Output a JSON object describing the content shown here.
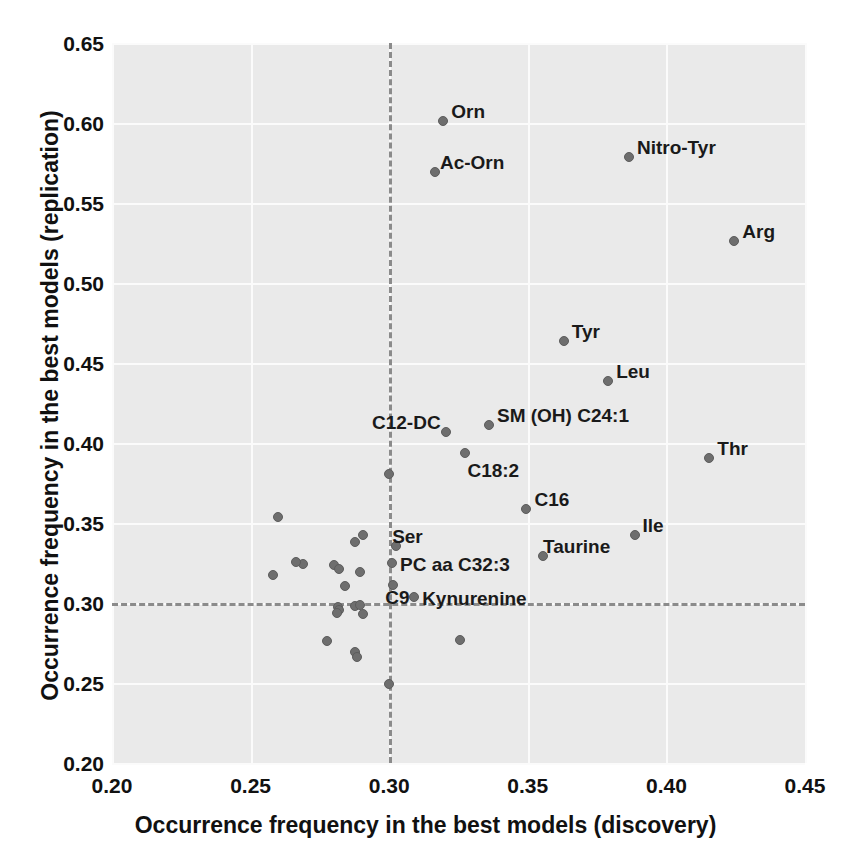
{
  "chart_data": {
    "type": "scatter",
    "title": "",
    "xlabel": "Occurrence frequency in the best models (discovery)",
    "ylabel": "Occurrence frequency in the best models (replication)",
    "xlim": [
      0.2,
      0.45
    ],
    "ylim": [
      0.2,
      0.65
    ],
    "xticks": [
      "0.20",
      "0.25",
      "0.30",
      "0.35",
      "0.40",
      "0.45"
    ],
    "xtick_values": [
      0.2,
      0.25,
      0.3,
      0.35,
      0.4,
      0.45
    ],
    "yticks": [
      "0.20",
      "0.25",
      "0.30",
      "0.35",
      "0.40",
      "0.45",
      "0.50",
      "0.55",
      "0.60",
      "0.65"
    ],
    "ytick_values": [
      0.2,
      0.25,
      0.3,
      0.35,
      0.4,
      0.45,
      0.5,
      0.55,
      0.6,
      0.65
    ],
    "grid": true,
    "legend": "none",
    "reference_lines": [
      {
        "orientation": "vertical",
        "value": 0.3,
        "style": "dashed",
        "color": "#8b8b8b"
      },
      {
        "orientation": "horizontal",
        "value": 0.3,
        "style": "dashed",
        "color": "#8b8b8b"
      }
    ],
    "marker_color": "#6e6e6e",
    "plot_background": "#eaeaea",
    "points": [
      {
        "label": "Orn",
        "x": 0.3195,
        "y": 0.6015,
        "lx": 8,
        "ly": -19
      },
      {
        "label": "Ac-Orn",
        "x": 0.3165,
        "y": 0.5695,
        "lx": 5,
        "ly": -19
      },
      {
        "label": "Nitro-Tyr",
        "x": 0.3865,
        "y": 0.5785,
        "lx": 8,
        "ly": -19
      },
      {
        "label": "Arg",
        "x": 0.4245,
        "y": 0.5265,
        "lx": 8,
        "ly": -19
      },
      {
        "label": "Tyr",
        "x": 0.363,
        "y": 0.464,
        "lx": 8,
        "ly": -19
      },
      {
        "label": "Leu",
        "x": 0.379,
        "y": 0.4385,
        "lx": 8,
        "ly": -19
      },
      {
        "label": "C12-DC",
        "x": 0.3205,
        "y": 0.407,
        "lx": -74,
        "ly": -19
      },
      {
        "label": "SM (OH) C24:1",
        "x": 0.336,
        "y": 0.411,
        "lx": 8,
        "ly": -19
      },
      {
        "label": "Thr",
        "x": 0.4155,
        "y": 0.3905,
        "lx": 8,
        "ly": -19
      },
      {
        "label": "C18:2",
        "x": 0.3275,
        "y": 0.394,
        "lx": 2,
        "ly": 8
      },
      {
        "label": "C16",
        "x": 0.3495,
        "y": 0.3585,
        "lx": 8,
        "ly": -19
      },
      {
        "label": "Ile",
        "x": 0.3885,
        "y": 0.3425,
        "lx": 8,
        "ly": -19
      },
      {
        "label": "Ser",
        "x": 0.3025,
        "y": 0.3355,
        "lx": -4,
        "ly": -19
      },
      {
        "label": "Taurine",
        "x": 0.3555,
        "y": 0.3295,
        "lx": 0,
        "ly": -19
      },
      {
        "label": "PC aa C32:3",
        "x": 0.301,
        "y": 0.325,
        "lx": 8,
        "ly": -8
      },
      {
        "label": "C9",
        "x": 0.3015,
        "y": 0.311,
        "lx": -8,
        "ly": 3
      },
      {
        "label": "Kynurenine",
        "x": 0.309,
        "y": 0.304,
        "lx": 8,
        "ly": -8
      },
      {
        "label": "",
        "x": 0.3,
        "y": 0.3805
      },
      {
        "label": "",
        "x": 0.26,
        "y": 0.354
      },
      {
        "label": "",
        "x": 0.2905,
        "y": 0.3425
      },
      {
        "label": "",
        "x": 0.2875,
        "y": 0.338
      },
      {
        "label": "",
        "x": 0.269,
        "y": 0.3245
      },
      {
        "label": "",
        "x": 0.2665,
        "y": 0.3255
      },
      {
        "label": "",
        "x": 0.28,
        "y": 0.3235
      },
      {
        "label": "",
        "x": 0.282,
        "y": 0.321
      },
      {
        "label": "",
        "x": 0.2895,
        "y": 0.3195
      },
      {
        "label": "",
        "x": 0.258,
        "y": 0.3175
      },
      {
        "label": "",
        "x": 0.284,
        "y": 0.3105
      },
      {
        "label": "",
        "x": 0.2875,
        "y": 0.298
      },
      {
        "label": "",
        "x": 0.2895,
        "y": 0.2985
      },
      {
        "label": "",
        "x": 0.2815,
        "y": 0.2975
      },
      {
        "label": "",
        "x": 0.282,
        "y": 0.2955
      },
      {
        "label": "",
        "x": 0.281,
        "y": 0.2935
      },
      {
        "label": "",
        "x": 0.2905,
        "y": 0.293
      },
      {
        "label": "",
        "x": 0.2775,
        "y": 0.2765
      },
      {
        "label": "",
        "x": 0.2875,
        "y": 0.2695
      },
      {
        "label": "",
        "x": 0.2885,
        "y": 0.266
      },
      {
        "label": "",
        "x": 0.3255,
        "y": 0.277
      },
      {
        "label": "",
        "x": 0.3,
        "y": 0.2495
      }
    ]
  }
}
